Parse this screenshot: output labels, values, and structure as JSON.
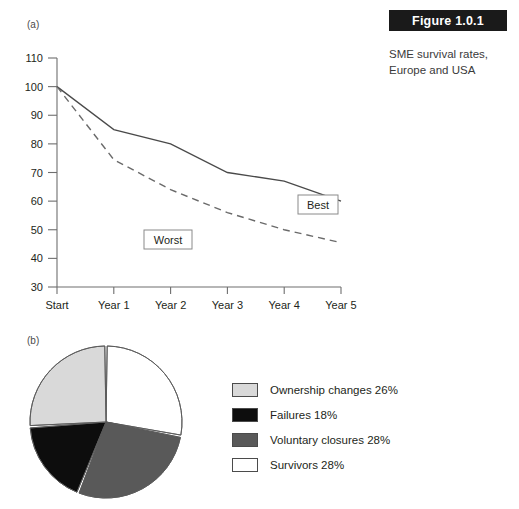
{
  "figure": {
    "header_label": "Figure 1.0.1",
    "caption": "SME survival rates, Europe and USA",
    "panel_a_label": "(a)",
    "panel_b_label": "(b)"
  },
  "chart_data": [
    {
      "type": "line",
      "panel": "(a)",
      "title": "SME survival rates, Europe and USA",
      "xlabel": "",
      "ylabel": "",
      "x": [
        "Start",
        "Year 1",
        "Year 2",
        "Year 3",
        "Year 4",
        "Year 5"
      ],
      "categories": [
        "Start",
        "Year 1",
        "Year 2",
        "Year 3",
        "Year 4",
        "Year 5"
      ],
      "yticks": [
        30,
        40,
        50,
        60,
        70,
        80,
        90,
        100,
        110
      ],
      "ylim": [
        30,
        110
      ],
      "grid": false,
      "legend_position": "inline-callout",
      "series": [
        {
          "name": "Best",
          "style": "solid",
          "color": "#4a4a4a",
          "values": [
            100,
            85,
            80,
            70,
            67,
            60
          ],
          "callout_label": "Best"
        },
        {
          "name": "Worst",
          "style": "dashed",
          "color": "#6a6a6a",
          "values": [
            100,
            74.5,
            64,
            56,
            50,
            45.5
          ],
          "callout_label": "Worst"
        }
      ]
    },
    {
      "type": "pie",
      "panel": "(b)",
      "title": "",
      "legend_position": "right",
      "labels": [
        "Ownership changes",
        "Failures",
        "Voluntary closures",
        "Survivors"
      ],
      "values": [
        26,
        18,
        28,
        28
      ],
      "value_suffix": "%",
      "colors": [
        "#d9d9d9",
        "#0d0d0d",
        "#595959",
        "#ffffff"
      ],
      "slices": [
        {
          "label": "Survivors",
          "value": 28,
          "legend_text": "Survivors 28%",
          "color": "#ffffff"
        },
        {
          "label": "Voluntary closures",
          "value": 28,
          "legend_text": "Voluntary closures 28%",
          "color": "#595959"
        },
        {
          "label": "Failures",
          "value": 18,
          "legend_text": "Failures 18%",
          "color": "#0d0d0d"
        },
        {
          "label": "Ownership changes",
          "value": 26,
          "legend_text": "Ownership changes 26%",
          "color": "#d9d9d9"
        }
      ],
      "legend": [
        {
          "swatch_color": "#d9d9d9",
          "text": "Ownership changes 26%"
        },
        {
          "swatch_color": "#0d0d0d",
          "text": "Failures 18%"
        },
        {
          "swatch_color": "#595959",
          "text": "Voluntary closures 28%"
        },
        {
          "swatch_color": "#ffffff",
          "text": "Survivors 28%"
        }
      ]
    }
  ],
  "line_chart": {
    "ytick_labels": [
      "110",
      "100",
      "90",
      "80",
      "70",
      "60",
      "50",
      "40",
      "30"
    ],
    "xtick_labels": [
      "Start",
      "Year 1",
      "Year 2",
      "Year 3",
      "Year 4",
      "Year 5"
    ],
    "best_label": "Best",
    "worst_label": "Worst"
  }
}
